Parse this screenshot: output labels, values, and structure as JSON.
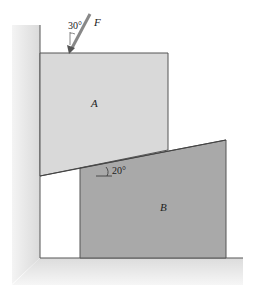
{
  "diagram": {
    "force": {
      "label": "F",
      "angle_label": "30°"
    },
    "block_a": {
      "label": "A",
      "color": "#d9d9d9"
    },
    "block_b": {
      "label": "B",
      "color": "#a9a9a9"
    },
    "wedge_angle_label": "20°",
    "wall_color": "#e6e6e6",
    "line_color": "#555555"
  }
}
